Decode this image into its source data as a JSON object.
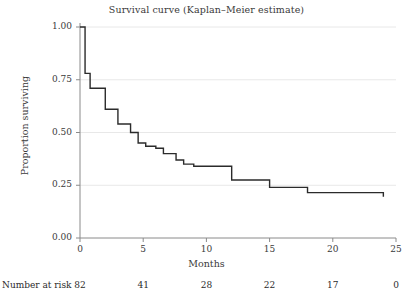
{
  "chart_data": {
    "type": "line",
    "subtype": "kaplan-meier-step",
    "title": "Survival curve (Kaplan–Meier estimate)",
    "xlabel": "Months",
    "ylabel": "Proportion surviving",
    "xlim": [
      0,
      25
    ],
    "ylim": [
      0.0,
      1.0
    ],
    "grid": "horizontal",
    "legend": "none",
    "xticks": [
      0,
      5,
      10,
      15,
      20,
      25
    ],
    "xticklabels": [
      "0",
      "5",
      "10",
      "15",
      "20",
      "25"
    ],
    "yticks": [
      0.0,
      0.25,
      0.5,
      0.75,
      1.0
    ],
    "yticklabels": [
      "0.00",
      "0.25",
      "0.50",
      "0.75",
      "1.00"
    ],
    "line_color": "#2b2b2b",
    "grid_color": "#e8e8e8",
    "axis_color": "#8a8a8a",
    "series": [
      {
        "name": "Survival",
        "x": [
          0.0,
          0.4,
          0.4,
          0.8,
          0.8,
          2.0,
          2.0,
          3.0,
          3.0,
          4.0,
          4.0,
          4.6,
          4.6,
          5.2,
          5.2,
          6.0,
          6.0,
          6.6,
          6.6,
          7.6,
          7.6,
          8.2,
          8.2,
          9.0,
          9.0,
          12.0,
          12.0,
          15.0,
          15.0,
          18.0,
          18.0,
          24.0,
          24.0
        ],
        "y": [
          1.0,
          1.0,
          0.78,
          0.78,
          0.71,
          0.71,
          0.61,
          0.61,
          0.54,
          0.54,
          0.5,
          0.5,
          0.45,
          0.45,
          0.435,
          0.435,
          0.425,
          0.425,
          0.4,
          0.4,
          0.37,
          0.37,
          0.35,
          0.35,
          0.34,
          0.34,
          0.275,
          0.275,
          0.24,
          0.24,
          0.215,
          0.215,
          0.195
        ]
      }
    ],
    "risk_table": {
      "label": "Number at risk",
      "times": [
        0,
        5,
        10,
        15,
        20,
        25
      ],
      "counts": [
        "82",
        "41",
        "28",
        "22",
        "17",
        "0"
      ]
    }
  }
}
